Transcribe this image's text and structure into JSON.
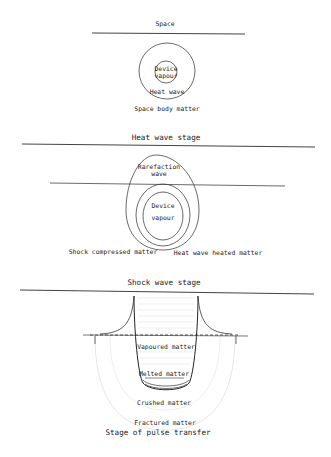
{
  "stage1": {
    "title": "Space",
    "inner": "Device",
    "inner2": "vapour",
    "ring": "Heat wave",
    "bottom": "Space body matter"
  },
  "stage2": {
    "title": "Heat wave stage",
    "top": "Rarefaction",
    "top2": "wave",
    "inner": "Device",
    "inner2": "vapour",
    "left": "Shock compressed matter",
    "right": "Heat wave heated matter"
  },
  "stage3": {
    "title": "Shock wave stage",
    "vapoured": "Vapoured matter",
    "melted": "Melted matter",
    "crushed": "Crushed matter",
    "fractured": "Fractured matter",
    "caption": "Stage of pulse transfer"
  },
  "colors": {
    "line": "#333333",
    "faint": "#d8d8d8"
  }
}
